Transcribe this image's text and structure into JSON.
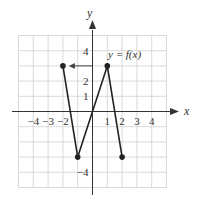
{
  "chart_data": {
    "type": "line",
    "title": "",
    "xlabel": "x",
    "ylabel": "y",
    "function_label": "y = f(x)",
    "xlim": [
      -5,
      5
    ],
    "ylim": [
      -5,
      5
    ],
    "grid": true,
    "x_tick_labels": [
      "-4",
      "-3",
      "-2",
      "1",
      "2",
      "3",
      "4"
    ],
    "y_tick_labels": [
      "4",
      "2",
      "1",
      "-4"
    ],
    "series": [
      {
        "name": "f(x)",
        "x": [
          -2,
          -1,
          1,
          2
        ],
        "y": [
          3,
          -3,
          3,
          -3
        ],
        "endpoints": "closed"
      }
    ],
    "annotations": [
      {
        "type": "arrow",
        "from": [
          0,
          3
        ],
        "to": [
          -2,
          3
        ],
        "note": "horizontal arrow from y-axis at y=3 to point (-2,3)"
      }
    ],
    "colors": {
      "line": "#222222",
      "grid": "#cccccc",
      "axis": "#333333"
    }
  }
}
